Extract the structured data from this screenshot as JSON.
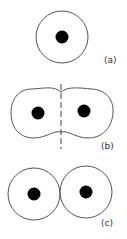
{
  "figure": {
    "panels": [
      {
        "id": "a",
        "label": "(a)",
        "description": "single atom with nucleus"
      },
      {
        "id": "b",
        "label": "(b)",
        "description": "two merged atoms with dividing dashed line"
      },
      {
        "id": "c",
        "label": "(c)",
        "description": "two touching atoms"
      }
    ]
  },
  "colors": {
    "outline": "#555555",
    "nucleus": "#000000",
    "background": "#ffffff"
  }
}
